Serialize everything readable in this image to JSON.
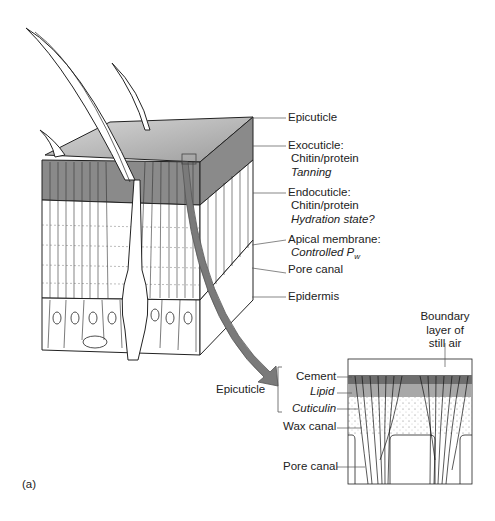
{
  "figure_label": "(a)",
  "block_labels": {
    "epicuticle": "Epicuticle",
    "exocuticle": {
      "title": "Exocuticle:",
      "composition": "Chitin/protein",
      "property": "Tanning"
    },
    "endocuticle": {
      "title": "Endocuticle:",
      "composition": "Chitin/protein",
      "property": "Hydration state?"
    },
    "apical_membrane": {
      "title": "Apical membrane:",
      "property": "Controlled P",
      "property_sub": "w"
    },
    "pore_canal": "Pore canal",
    "epidermis": "Epidermis"
  },
  "inset_labels": {
    "boundary_layer": [
      "Boundary",
      "layer of",
      "still air"
    ],
    "epicuticle_bracket": "Epicuticle",
    "cement": "Cement",
    "lipid": "Lipid",
    "cuticulin": "Cuticulin",
    "wax_canal": "Wax canal",
    "pore_canal": "Pore canal"
  },
  "colors": {
    "exocuticle_shade": "#8a8a8a",
    "epicuticle_top": "#b5b5b5",
    "arrow": "#7a7a7a",
    "cement": "#6e6e6e",
    "lipid": "#a8a8a8",
    "line": "#222222"
  }
}
